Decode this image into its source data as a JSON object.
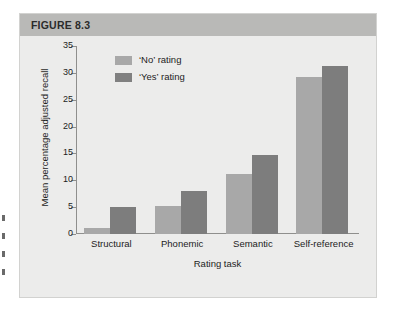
{
  "figure": {
    "header_label": "FIGURE 8.3"
  },
  "chart_data": {
    "type": "bar",
    "title": "FIGURE 8.3",
    "xlabel": "Rating task",
    "ylabel": "Mean percentage adjusted recall",
    "categories": [
      "Structural",
      "Phonemic",
      "Semantic",
      "Self-reference"
    ],
    "series": [
      {
        "name": "‘No’ rating",
        "color": "#a8a8a8",
        "values": [
          1.2,
          5.3,
          11.2,
          29.3
        ]
      },
      {
        "name": "‘Yes’ rating",
        "color": "#7d7d7d",
        "values": [
          5.0,
          8.0,
          14.8,
          31.3
        ]
      }
    ],
    "ylim": [
      0,
      35
    ],
    "yticks": [
      0,
      5,
      10,
      15,
      20,
      25,
      30,
      35
    ],
    "ytick_labels": [
      "0",
      "5",
      "10",
      "15",
      "20",
      "25",
      "30",
      "35"
    ],
    "grid": false,
    "legend_position": "top-left-inside"
  },
  "colors": {
    "header_band": "#b9b9b7",
    "plot_background": "#ececeb",
    "axis": "#8f8f8d",
    "bar_no": "#a8a8a8",
    "bar_yes": "#7d7d7d"
  }
}
